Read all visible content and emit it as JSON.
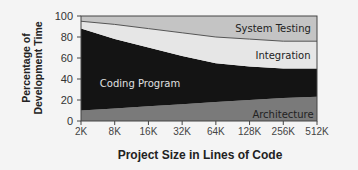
{
  "chart_data": {
    "type": "area",
    "stacked": true,
    "title": "",
    "xlabel": "Project Size in Lines of Code",
    "ylabel": "Percentage of Development Time",
    "ylabel_lines": [
      "Percentage of",
      "Development Time"
    ],
    "ylim": [
      0,
      100
    ],
    "yticks": [
      "0",
      "20",
      "40",
      "60",
      "80",
      "100"
    ],
    "categories": [
      "2K",
      "8K",
      "16K",
      "32K",
      "64K",
      "128K",
      "256K",
      "512K"
    ],
    "grid": false,
    "legend": "inline labels",
    "series": [
      {
        "name": "Architecture",
        "values": [
          10,
          12,
          14,
          16,
          18,
          20,
          22,
          23
        ],
        "color": "#7a7a7a",
        "label_color": "#222222"
      },
      {
        "name": "Coding Program",
        "values": [
          78,
          66,
          56,
          46,
          37,
          32,
          28,
          27
        ],
        "color": "#141414",
        "label_color": "#e0e0e0"
      },
      {
        "name": "Integration",
        "values": [
          7,
          14,
          18,
          22,
          25,
          26,
          26,
          26
        ],
        "color": "#e6e6e6",
        "label_color": "#222222"
      },
      {
        "name": "System Testing",
        "values": [
          5,
          8,
          12,
          16,
          20,
          22,
          24,
          24
        ],
        "color": "#c4c4c4",
        "label_color": "#222222"
      }
    ]
  }
}
